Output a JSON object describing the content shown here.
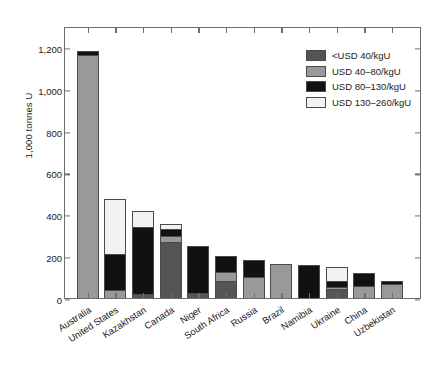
{
  "chart_data": {
    "type": "bar",
    "subtype": "stacked-vertical",
    "title": "",
    "xlabel": "",
    "ylabel": "1,000 tonnes U",
    "ylim": [
      0,
      1300
    ],
    "yticks": [
      0,
      200,
      400,
      600,
      800,
      1000,
      1200
    ],
    "ytick_labels": [
      "0",
      "200",
      "400",
      "600",
      "800",
      "1,000",
      "1,200"
    ],
    "grid": false,
    "legend_position": "upper-right",
    "categories": [
      "Australia",
      "United States",
      "Kazakhstan",
      "Canada",
      "Niger",
      "South Africa",
      "Russia",
      "Brazil",
      "Namibia",
      "Ukraine",
      "China",
      "Uzbekistan"
    ],
    "series": [
      {
        "name": "<USD 40/kgU",
        "color": "#555555",
        "values": [
          0,
          0,
          20,
          268,
          22,
          80,
          0,
          0,
          0,
          42,
          0,
          0
        ]
      },
      {
        "name": "USD 40–80/kgU",
        "color": "#999999",
        "values": [
          1163,
          36,
          0,
          30,
          0,
          45,
          102,
          161,
          0,
          12,
          58,
          68
        ]
      },
      {
        "name": "USD 80–130/kgU",
        "color": "#111111",
        "values": [
          18,
          172,
          318,
          30,
          225,
          75,
          82,
          0,
          160,
          28,
          62,
          14
        ]
      },
      {
        "name": "USD 130–260/kgU",
        "color": "#f2f2f2",
        "values": [
          0,
          266,
          80,
          27,
          0,
          0,
          0,
          0,
          0,
          66,
          0,
          0
        ]
      }
    ],
    "totals": [
      1181,
      474,
      418,
      355,
      247,
      200,
      184,
      161,
      160,
      148,
      120,
      82
    ]
  },
  "legend": {
    "items": [
      {
        "label": "<USD 40/kgU",
        "color": "#555555"
      },
      {
        "label": "USD 40–80/kgU",
        "color": "#999999"
      },
      {
        "label": "USD 80–130/kgU",
        "color": "#111111"
      },
      {
        "label": "USD 130–260/kgU",
        "color": "#f2f2f2"
      }
    ]
  },
  "colors": {
    "axis": "#6d6d6d",
    "text": "#1a1a1a",
    "background": "#ffffff",
    "bar_outline": "#4a4a4a"
  }
}
